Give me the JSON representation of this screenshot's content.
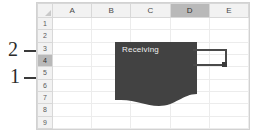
{
  "callouts": [
    {
      "id": "2",
      "label": "2"
    },
    {
      "id": "1",
      "label": "1"
    }
  ],
  "spreadsheet": {
    "select_all_label": "",
    "columns": [
      "A",
      "B",
      "C",
      "D",
      "E"
    ],
    "selected_column": "D",
    "rows": [
      "1",
      "2",
      "3",
      "4",
      "5",
      "6",
      "7",
      "8",
      "9"
    ],
    "selected_row": "4"
  },
  "shape": {
    "label": "Receiving",
    "fill_color": "#424242",
    "text_color": "#f0f0f0"
  },
  "connector": {
    "line_color": "#4a4a4a",
    "handle_color": "#3a3a3a"
  },
  "colors": {
    "grid_line": "#ececec",
    "header_bg": "#f2f2f2",
    "header_selected_bg": "#b9b9b9",
    "frame_border": "#d2d2d2",
    "leader_line": "#3a3a3a",
    "callout_text": "#2b2b2b"
  }
}
